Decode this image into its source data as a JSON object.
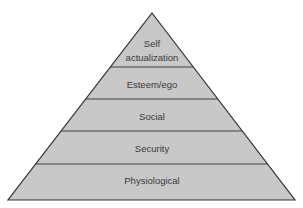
{
  "diagram": {
    "type": "pyramid",
    "fill_color": "#c8c8c8",
    "stroke_color": "#333333",
    "levels_top_to_bottom": [
      {
        "lines": [
          "Self",
          "actualization"
        ]
      },
      {
        "lines": [
          "Esteem/ego"
        ]
      },
      {
        "lines": [
          "Social"
        ]
      },
      {
        "lines": [
          "Security"
        ]
      },
      {
        "lines": [
          "Physiological"
        ]
      }
    ]
  }
}
